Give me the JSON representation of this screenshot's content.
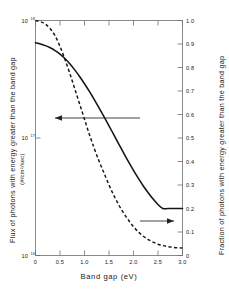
{
  "chart_data": {
    "type": "line",
    "title": "",
    "xlabel": "Band gap (eV)",
    "ylabel_left": "Flux of photons with energy greater than the band gap",
    "ylabel_left_units": "(#/cm²/sec)",
    "ylabel_right": "Fraction of photons with energy greater than the band gap",
    "xlim": [
      0,
      3.0
    ],
    "xticks": [
      0,
      0.5,
      1.0,
      1.5,
      2.0,
      2.5,
      3.0
    ],
    "xticklabels": [
      "0",
      "0.5",
      "1.0",
      "1.5",
      "2.0",
      "2.5",
      "3.0"
    ],
    "left_axis_scale": "log",
    "left_ylim": [
      1e+16,
      1e+18
    ],
    "left_yticks": [
      1e+16,
      1e+17,
      1e+18
    ],
    "left_yticklabels": [
      "10",
      "10",
      "10"
    ],
    "left_ytick_exponents": [
      "16",
      "17",
      "18"
    ],
    "right_axis_scale": "linear",
    "right_ylim": [
      0,
      1.0
    ],
    "right_yticks": [
      0,
      0.1,
      0.2,
      0.3,
      0.4,
      0.5,
      0.6,
      0.7,
      0.8,
      0.9,
      1.0
    ],
    "right_yticklabels": [
      "0",
      "0.1",
      "0.2",
      "0.3",
      "0.4",
      "0.5",
      "0.6",
      "0.7",
      "0.8",
      "0.9",
      "1.0"
    ],
    "grid": false,
    "legend": "arrow annotations pointing to the owning axis",
    "series": [
      {
        "name": "Flux of photons with energy greater than the band gap",
        "style": "dashed",
        "axis": "right",
        "annotation_arrow": "right-pointing arrow to the fraction axis",
        "x": [
          0,
          0.1,
          0.2,
          0.3,
          0.4,
          0.5,
          0.6,
          0.7,
          0.8,
          0.9,
          1.0,
          1.1,
          1.2,
          1.3,
          1.4,
          1.5,
          1.6,
          1.7,
          1.8,
          1.9,
          2.0,
          2.1,
          2.2,
          2.3,
          2.4,
          2.5,
          2.6,
          2.7,
          2.8,
          2.9,
          3.0
        ],
        "values": [
          1.0,
          0.995,
          0.985,
          0.965,
          0.935,
          0.89,
          0.835,
          0.775,
          0.71,
          0.645,
          0.58,
          0.515,
          0.455,
          0.4,
          0.35,
          0.3,
          0.255,
          0.215,
          0.18,
          0.15,
          0.122,
          0.1,
          0.082,
          0.068,
          0.057,
          0.048,
          0.042,
          0.038,
          0.035,
          0.033,
          0.032
        ]
      },
      {
        "name": "Fraction of photons with energy greater than the band gap",
        "style": "solid",
        "axis": "left",
        "annotation_arrow": "left-pointing arrow to the flux axis",
        "x": [
          0,
          0.1,
          0.2,
          0.3,
          0.4,
          0.5,
          0.6,
          0.7,
          0.8,
          0.9,
          1.0,
          1.1,
          1.2,
          1.3,
          1.4,
          1.5,
          1.6,
          1.7,
          1.8,
          1.9,
          2.0,
          2.1,
          2.2,
          2.3,
          2.4,
          2.5,
          2.6,
          2.7,
          2.8,
          2.9,
          3.0
        ],
        "values": [
          0.905,
          0.9,
          0.893,
          0.884,
          0.872,
          0.857,
          0.838,
          0.816,
          0.79,
          0.762,
          0.731,
          0.698,
          0.663,
          0.627,
          0.59,
          0.552,
          0.513,
          0.474,
          0.436,
          0.398,
          0.362,
          0.328,
          0.296,
          0.267,
          0.24,
          0.217,
          0.2,
          0.2,
          0.2,
          0.2,
          0.2
        ]
      }
    ],
    "annotations": [
      {
        "name": "left-arrow",
        "direction": "left",
        "from_x": 1.9,
        "to_x": 0.33,
        "y_fraction": 0.585
      },
      {
        "name": "right-arrow",
        "direction": "right",
        "from_x": 1.9,
        "to_x": 2.82,
        "y_fraction": 0.144
      }
    ]
  }
}
